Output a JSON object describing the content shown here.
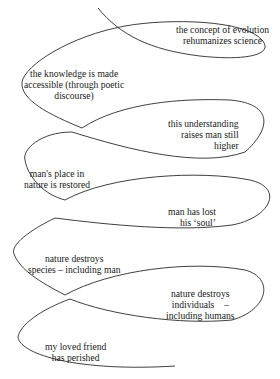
{
  "diagram": {
    "type": "spiral-narrative",
    "stroke_color": "#2a2a2a",
    "labels": [
      {
        "id": "concept-evolution",
        "text": "the concept of evolution\nrehumanizes science"
      },
      {
        "id": "knowledge-accessible",
        "text": "the knowledge is made\naccessible (through poetic\ndiscourse)"
      },
      {
        "id": "understanding-raises",
        "text": "this understanding\nraises man still\nhigher"
      },
      {
        "id": "place-restored",
        "text": "man's place in\nnature is restored"
      },
      {
        "id": "lost-soul",
        "text": "man has lost\nhis ‘soul’"
      },
      {
        "id": "destroys-species",
        "text": "nature destroys\nspecies – including man"
      },
      {
        "id": "destroys-individuals",
        "text": "nature destroys\nindividuals    –\nincluding humans"
      },
      {
        "id": "friend-perished",
        "text": "my loved friend\nhas perished"
      }
    ]
  }
}
